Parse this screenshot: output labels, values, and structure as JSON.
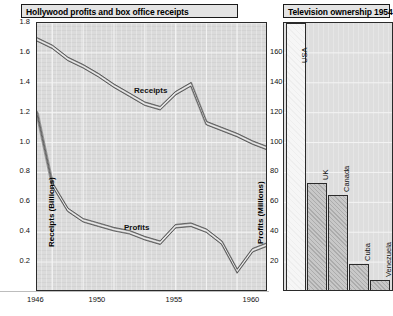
{
  "left_panel": {
    "title": "Hollywood profits and box office receipts",
    "y_left_axis_label": "Receipts (Billions)",
    "y_right_axis_label": "Profits (Millions)",
    "y_left_ticks": [
      "1.8",
      "1.6",
      "1.4",
      "1.2",
      "1.0",
      "0.8",
      "0.6",
      "0.4",
      "0.2"
    ],
    "y_right_ticks": [
      "160",
      "140",
      "120",
      "100",
      "80",
      "60",
      "40",
      "20"
    ],
    "x_ticks": [
      "1946",
      "1950",
      "1955",
      "1960"
    ],
    "series_labels": {
      "receipts": "Receipts",
      "profits": "Profits"
    }
  },
  "right_panel": {
    "title": "Television ownership 1954",
    "bar_labels": [
      "USA",
      "UK",
      "Canada",
      "Cuba",
      "Venezuela"
    ]
  },
  "colors": {
    "plot_bg": "#dedede",
    "panel_border": "#1a1a1a",
    "grid": "#f4f4f4",
    "line_fill": "#9a9a9a",
    "bar_fill": "#c8c8c8",
    "bar_fill_light": "#f6f6f6",
    "text": "#111111"
  },
  "chart_data": [
    {
      "type": "line",
      "title": "Hollywood profits and box office receipts",
      "xlabel": "",
      "ylabel": "Receipts (Billions)",
      "y2label": "Profits (Millions)",
      "xlim": [
        1946,
        1961
      ],
      "ylim": [
        0.0,
        1.8
      ],
      "y2lim": [
        0,
        180
      ],
      "grid": true,
      "legend": "inline-labels",
      "x": [
        1946,
        1947,
        1948,
        1949,
        1950,
        1951,
        1952,
        1953,
        1954,
        1955,
        1956,
        1957,
        1958,
        1959,
        1960,
        1961
      ],
      "series": [
        {
          "name": "Receipts",
          "axis": "left",
          "units": "Billions of dollars",
          "values": [
            1.69,
            1.64,
            1.56,
            1.51,
            1.45,
            1.38,
            1.32,
            1.26,
            1.23,
            1.33,
            1.39,
            1.13,
            1.09,
            1.05,
            1.0,
            0.96
          ]
        },
        {
          "name": "Profits",
          "axis": "right",
          "units": "Millions of dollars",
          "values": [
            120,
            72,
            55,
            48,
            45,
            42,
            40,
            36,
            33,
            44,
            45,
            41,
            33,
            14,
            28,
            32
          ]
        }
      ]
    },
    {
      "type": "bar",
      "title": "Television ownership 1954",
      "xlabel": "",
      "ylabel": "",
      "ylim": [
        0,
        180
      ],
      "grid": true,
      "categories": [
        "USA",
        "UK",
        "Canada",
        "Cuba",
        "Venezuela"
      ],
      "values": [
        180,
        73,
        65,
        19,
        8
      ],
      "notes": "USA bar extends beyond the top of the plotted range"
    }
  ]
}
